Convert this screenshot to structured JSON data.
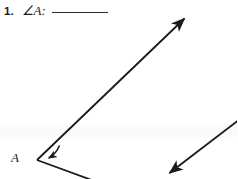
{
  "page": {
    "width": 237,
    "height": 179,
    "background_color": "#ffffff",
    "ink_color": "#1a1a1a"
  },
  "prompt": {
    "item_number": "1.",
    "angle_expression": "∠A:",
    "answer_blank_value": "",
    "answer_blank_width_px": 56
  },
  "figure": {
    "vertex_label": "A",
    "vertex_point": [
      37,
      160
    ],
    "arc": {
      "name": "angle-measure-arc",
      "radius_px": 26,
      "has_arrowhead": true,
      "arrowhead_point": [
        48,
        163
      ]
    },
    "rays": [
      {
        "name": "upper-ray",
        "from": [
          37,
          160
        ],
        "to": [
          187,
          16
        ],
        "has_arrowhead": true
      },
      {
        "name": "lower-ray",
        "from": [
          37,
          160
        ],
        "to": [
          92,
          180
        ],
        "has_arrowhead": false
      },
      {
        "name": "secondary-ray",
        "from": [
          240,
          120
        ],
        "to": [
          167,
          175
        ],
        "has_arrowhead": true
      }
    ],
    "stroke_color": "#1a1a1a",
    "stroke_width_px": 1.8
  },
  "tint_band": {
    "name": "background-tint-band",
    "top_px": 122,
    "height_px": 20,
    "color": "rgba(0,0,0,0.022)"
  }
}
